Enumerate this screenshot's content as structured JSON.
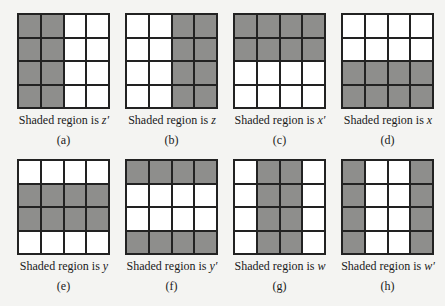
{
  "figure": {
    "caption_prefix": "Shaded region is",
    "panels": [
      {
        "id": "a",
        "label": "(a)",
        "variable": "z′",
        "shaded": [
          [
            1,
            1,
            0,
            0
          ],
          [
            1,
            1,
            0,
            0
          ],
          [
            1,
            1,
            0,
            0
          ],
          [
            1,
            1,
            0,
            0
          ]
        ]
      },
      {
        "id": "b",
        "label": "(b)",
        "variable": "z",
        "shaded": [
          [
            0,
            0,
            1,
            1
          ],
          [
            0,
            0,
            1,
            1
          ],
          [
            0,
            0,
            1,
            1
          ],
          [
            0,
            0,
            1,
            1
          ]
        ]
      },
      {
        "id": "c",
        "label": "(c)",
        "variable": "x′",
        "shaded": [
          [
            1,
            1,
            1,
            1
          ],
          [
            1,
            1,
            1,
            1
          ],
          [
            0,
            0,
            0,
            0
          ],
          [
            0,
            0,
            0,
            0
          ]
        ]
      },
      {
        "id": "d",
        "label": "(d)",
        "variable": "x",
        "shaded": [
          [
            0,
            0,
            0,
            0
          ],
          [
            0,
            0,
            0,
            0
          ],
          [
            1,
            1,
            1,
            1
          ],
          [
            1,
            1,
            1,
            1
          ]
        ]
      },
      {
        "id": "e",
        "label": "(e)",
        "variable": "y",
        "shaded": [
          [
            0,
            0,
            0,
            0
          ],
          [
            1,
            1,
            1,
            1
          ],
          [
            1,
            1,
            1,
            1
          ],
          [
            0,
            0,
            0,
            0
          ]
        ]
      },
      {
        "id": "f",
        "label": "(f)",
        "variable": "y′",
        "shaded": [
          [
            1,
            1,
            1,
            1
          ],
          [
            0,
            0,
            0,
            0
          ],
          [
            0,
            0,
            0,
            0
          ],
          [
            1,
            1,
            1,
            1
          ]
        ]
      },
      {
        "id": "g",
        "label": "(g)",
        "variable": "w",
        "shaded": [
          [
            0,
            1,
            1,
            0
          ],
          [
            0,
            1,
            1,
            0
          ],
          [
            0,
            1,
            1,
            0
          ],
          [
            0,
            1,
            1,
            0
          ]
        ]
      },
      {
        "id": "h",
        "label": "(h)",
        "variable": "w′",
        "shaded": [
          [
            1,
            0,
            0,
            1
          ],
          [
            1,
            0,
            0,
            1
          ],
          [
            1,
            0,
            0,
            1
          ],
          [
            1,
            0,
            0,
            1
          ]
        ]
      }
    ]
  },
  "colors": {
    "shaded": "#8e8e8c",
    "unshaded": "#ffffff",
    "lines": "#222222"
  }
}
